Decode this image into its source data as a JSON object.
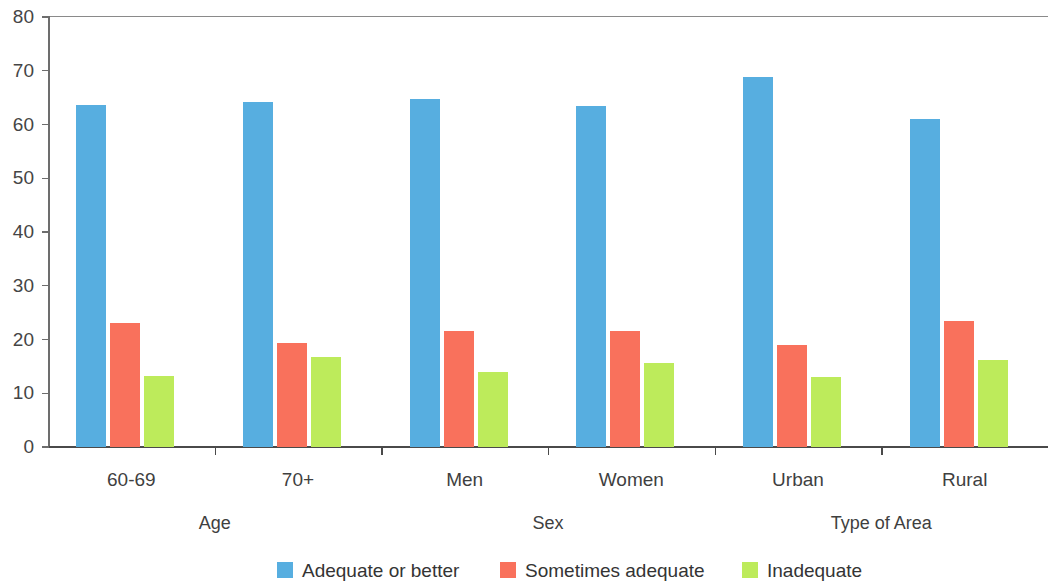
{
  "chart_data": {
    "type": "bar",
    "title": "",
    "subtitle": "",
    "xlabel": "",
    "ylabel": "",
    "ylim": [
      0,
      80
    ],
    "yticks": [
      0,
      10,
      20,
      30,
      40,
      50,
      60,
      70,
      80
    ],
    "ytick_labels": [
      "0",
      "10",
      "20",
      "30",
      "40",
      "50",
      "60",
      "70",
      "80"
    ],
    "grid": false,
    "legend_position": "bottom",
    "categories": [
      "60-69",
      "70+",
      "Men",
      "Women",
      "Urban",
      "Rural"
    ],
    "category_groups": [
      {
        "label": "Age",
        "categories": [
          "60-69",
          "70+"
        ]
      },
      {
        "label": "Sex",
        "categories": [
          "Men",
          "Women"
        ]
      },
      {
        "label": "Type of Area",
        "categories": [
          "Urban",
          "Rural"
        ]
      }
    ],
    "series": [
      {
        "name": "Adequate or better",
        "color": "#57aee0",
        "values": [
          63.6,
          64.2,
          64.8,
          63.4,
          68.8,
          61.0
        ]
      },
      {
        "name": "Sometimes adequate",
        "color": "#f9715c",
        "values": [
          23.1,
          19.4,
          21.5,
          21.5,
          19.0,
          23.4
        ]
      },
      {
        "name": "Inadequate",
        "color": "#bdeb5b",
        "values": [
          13.3,
          16.7,
          14.0,
          15.7,
          13.0,
          16.2
        ]
      }
    ],
    "legend": [
      {
        "label": "Adequate or better",
        "color": "#57aee0"
      },
      {
        "label": "Sometimes adequate",
        "color": "#f9715c"
      },
      {
        "label": "Inadequate",
        "color": "#bdeb5b"
      }
    ],
    "axis_color": "#4a4a4a",
    "text_color": "#3f3f3f"
  }
}
